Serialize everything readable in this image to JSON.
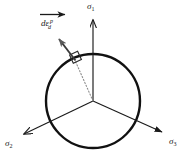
{
  "figure": {
    "type": "pi-plane-yield-surface-diagram",
    "background_color": "#ffffff",
    "line_color": "#1a1a1a",
    "dotted_line_color": "#8c8c8c"
  },
  "axes": {
    "sigma1": {
      "symbol": "σ",
      "subscript": "1",
      "label": "σ1",
      "direction_deg": 90,
      "arrow_tip": {
        "x": 93,
        "y": 18
      }
    },
    "sigma2": {
      "symbol": "σ",
      "subscript": "2",
      "label": "σ2",
      "direction_deg": 210,
      "arrow_tip": {
        "x": 21,
        "y": 136
      }
    },
    "sigma3": {
      "symbol": "σ",
      "subscript": "3",
      "label": "σ3",
      "direction_deg": 330,
      "arrow_tip": {
        "x": 165,
        "y": 134
      }
    },
    "origin": {
      "x": 93,
      "y": 101
    }
  },
  "yield_surface": {
    "name": "yield-circle",
    "center": {
      "x": 93,
      "y": 101
    },
    "radius": 47,
    "stroke_width": 2.4,
    "stroke_color": "#111111"
  },
  "strain_vector": {
    "name": "plastic-deviatoric-strain-increment",
    "symbol_parts": {
      "base": "dε",
      "subscript": "d",
      "superscript": "p"
    },
    "label": "dεd p",
    "tail": {
      "x": 75,
      "y": 61
    },
    "tip": {
      "x": 57,
      "y": 37
    },
    "normal_to_surface": true,
    "right_angle_marker": true
  },
  "radius_line": {
    "name": "radius-dotted-line",
    "from": {
      "x": 93,
      "y": 101
    },
    "to": {
      "x": 75,
      "y": 61
    },
    "style": "dotted"
  },
  "direction_arrow": {
    "name": "horizontal-direction-arrow",
    "from": {
      "x": 40,
      "y": 14
    },
    "to": {
      "x": 68,
      "y": 14
    }
  }
}
